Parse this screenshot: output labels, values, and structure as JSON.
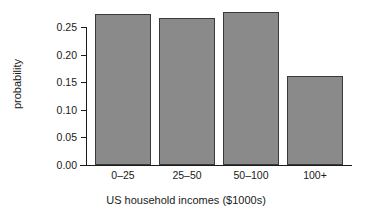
{
  "chart_data": {
    "type": "bar",
    "title": "",
    "subtitle": "",
    "xlabel": "US household incomes ($1000s)",
    "ylabel": "probability",
    "categories": [
      "0–25",
      "25–50",
      "50–100",
      "100+"
    ],
    "values": [
      0.273,
      0.266,
      0.277,
      0.162
    ],
    "ylim": [
      0.0,
      0.29
    ],
    "yticks": [
      0.0,
      0.05,
      0.1,
      0.15,
      0.2,
      0.25
    ],
    "ytick_labels": [
      "0.00",
      "0.05",
      "0.10",
      "0.15",
      "0.20",
      "0.25"
    ],
    "xtick_labels": [
      "0–25",
      "25–50",
      "50–100",
      "100+"
    ],
    "grid": false,
    "legend": null,
    "legend_position": "none",
    "bar_fill_color": "#8a8a8a",
    "bar_edge_color": "#3a3a3a",
    "axis_color": "#1a1a1a",
    "background_color": "#ffffff"
  },
  "axis": {
    "y_label": "probability",
    "x_label": "US household incomes ($1000s)"
  }
}
